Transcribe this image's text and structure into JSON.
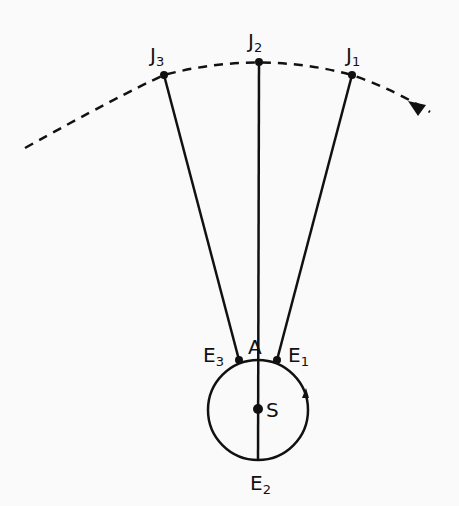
{
  "diagram": {
    "colors": {
      "ink": "#111111",
      "background": "#fafafa"
    },
    "jupiter_points": [
      {
        "label": "J",
        "sub": "3",
        "x": 164,
        "y": 75
      },
      {
        "label": "J",
        "sub": "2",
        "x": 259,
        "y": 62
      },
      {
        "label": "J",
        "sub": "1",
        "x": 352,
        "y": 75
      }
    ],
    "earth_points": [
      {
        "label": "E",
        "sub": "3",
        "x": 239,
        "y": 360
      },
      {
        "label": "E",
        "sub": "1",
        "x": 277,
        "y": 360
      },
      {
        "label": "E",
        "sub": "2",
        "x": 258,
        "y": 460
      }
    ],
    "sun": {
      "label": "S",
      "x": 258,
      "y": 409
    },
    "point_a": {
      "label": "A"
    },
    "orbit_circle": {
      "cx": 258,
      "cy": 410,
      "r": 50
    }
  }
}
